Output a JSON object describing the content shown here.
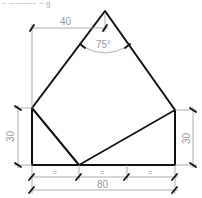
{
  "header": {
    "cropped_text": "~ ~~~~~~ ~ g"
  },
  "drawing": {
    "type": "technical-drawing",
    "colors": {
      "object_line": "#111111",
      "dimension_line": "#9a9a9a"
    },
    "dimensions": {
      "top_horizontal": "40",
      "apex_angle": "75°",
      "left_vertical": "30",
      "right_vertical": "30",
      "bottom_total": "80",
      "bottom_segment_1": "=",
      "bottom_segment_2": "=",
      "bottom_segment_3": "="
    }
  }
}
